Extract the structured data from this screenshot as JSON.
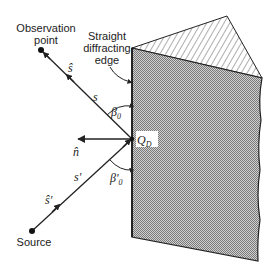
{
  "figure": {
    "labels": {
      "observation_point_line1": "Observation",
      "observation_point_line2": "point",
      "edge_line1": "Straight",
      "edge_line2": "diffracting",
      "edge_line3": "edge",
      "source": "Source",
      "s_hat": "ŝ",
      "s": "s",
      "beta0": "β",
      "beta0_sub": "0",
      "n_hat": "n̂",
      "qd": "Q",
      "qd_sub": "D",
      "s_prime": "s′",
      "s_hat_prime": "ŝ′",
      "beta0_prime": "β′",
      "beta0_prime_sub": "0"
    },
    "colors": {
      "line": "#222222",
      "plate_fill": "#a8a8a8",
      "background": "#ffffff"
    }
  }
}
